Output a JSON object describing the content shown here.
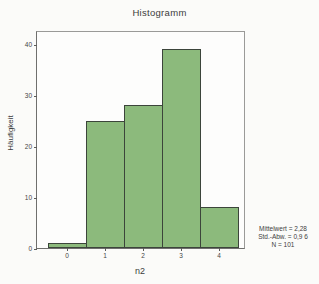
{
  "chart_data": {
    "type": "bar",
    "title": "Histogramm",
    "xlabel": "n2",
    "ylabel": "Häufigkeit",
    "categories": [
      "0",
      "1",
      "2",
      "3",
      "4"
    ],
    "values": [
      1,
      25,
      28,
      39,
      8
    ],
    "ylim": [
      0,
      40
    ],
    "yticks": [
      0,
      10,
      20,
      30,
      40
    ],
    "grid": false,
    "legend": "none",
    "bar_color": "#8cba7c",
    "bar_border_color": "#3c453b",
    "annotations": {
      "mean": "Mittelwert = 2,28",
      "std": "Std.-Abw. = 0,9 6",
      "n": "N = 101"
    }
  }
}
